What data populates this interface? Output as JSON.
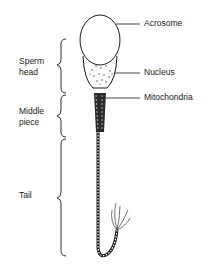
{
  "diagram": {
    "labels": {
      "acrosome": "Acrosome",
      "nucleus": "Nucleus",
      "mitochondria": "Mitochondria"
    },
    "regions": {
      "head": "Sperm\nhead",
      "middle": "Middle\npiece",
      "tail": "Tail"
    },
    "colors": {
      "ink": "#1a1a1a",
      "background": "#ffffff"
    }
  }
}
